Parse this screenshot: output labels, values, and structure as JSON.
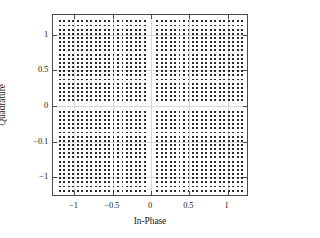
{
  "chart_data": {
    "type": "scatter",
    "title": "",
    "xlabel": "In-Phase",
    "ylabel": "Quadrature",
    "xlim": [
      -1.28,
      1.28
    ],
    "ylim": [
      -1.28,
      1.28
    ],
    "grid": true,
    "legend": null,
    "xticks": [
      -1,
      -0.5,
      0,
      0.5,
      1
    ],
    "xticklabels": [
      "−1",
      "−0.5",
      "0",
      "0.5",
      "1"
    ],
    "yticks": [
      1,
      0.5,
      0,
      -0.5,
      -1
    ],
    "yticklabels": [
      "1",
      "0.5",
      "0",
      "−0.1",
      "−1"
    ],
    "marker": "square",
    "marker_color": "#2b2b2b",
    "marker_size_px": 1.9,
    "constellation": {
      "points_per_quadrant_x": 20,
      "points_per_quadrant_y": 20,
      "total_points": 1600,
      "inner_offset": 0.08,
      "spacing": 0.0585,
      "block_min": 0.08,
      "block_max": 1.19
    }
  },
  "axes": {
    "frame_color": "#4a4a4a",
    "grid_color": "#d8d8d8",
    "background": "#ffffff"
  }
}
